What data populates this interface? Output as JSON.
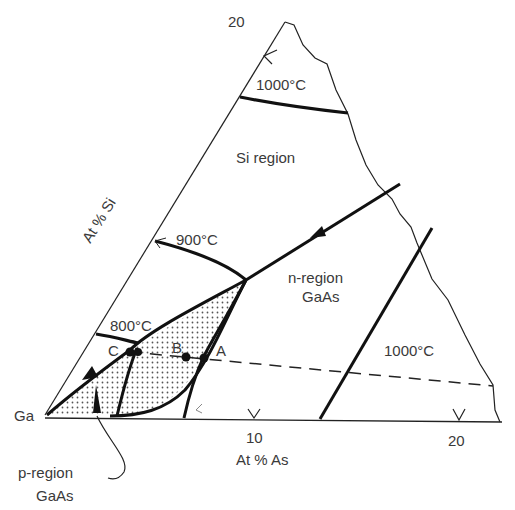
{
  "figure": {
    "type": "ternary-phase-diagram-section",
    "system": "Ga-As-Si",
    "axes": {
      "bottom_label": "At % As",
      "left_label": "At % Si",
      "bottom_ticks": [
        "10",
        "20"
      ],
      "left_ticks": [
        "20"
      ],
      "corner": "Ga"
    },
    "isotherms": [
      {
        "label": "1000°C",
        "position": "top"
      },
      {
        "label": "900°C",
        "position": "left"
      },
      {
        "label": "800°C",
        "position": "left-lower"
      },
      {
        "label": "1000°C",
        "position": "right",
        "id": "right-1000"
      }
    ],
    "regions": {
      "si": "Si region",
      "n_line1": "n-region",
      "n_line2": "GaAs",
      "p_line1": "p-region",
      "p_line2": "GaAs"
    },
    "points": [
      {
        "label": "A"
      },
      {
        "label": "B"
      },
      {
        "label": "C"
      }
    ],
    "colors": {
      "line": "#1a1a1a",
      "text": "#3a3a3a",
      "stipple": "#555555"
    }
  }
}
